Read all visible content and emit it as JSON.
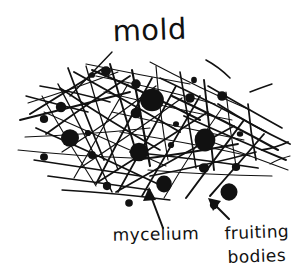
{
  "figure": {
    "title": "mold",
    "medium": "hand-drawn ink sketch on white paper",
    "background_color": "#ffffff",
    "ink_color": "#111111"
  },
  "labels": {
    "mold": {
      "text": "mold",
      "x": 150,
      "y": 40,
      "font_size": 29,
      "leader": "line from label down-left into hyphal mass"
    },
    "mycelium": {
      "text": "mycelium",
      "x": 156,
      "y": 240,
      "font_size": 17,
      "leader": "arrow pointing up into the tangled hyphae"
    },
    "fruiting_bodies": {
      "line1": "fruiting",
      "line2": "bodies",
      "x": 257,
      "y1": 238,
      "y2": 262,
      "font_size": 17,
      "leader": "arrow pointing up-left to a large black dot"
    }
  },
  "drawing": {
    "description": "A tangled mat of thin straight hyphal filaments crossing at many angles, studded with filled black circles representing fruiting bodies and spore heads.",
    "hyphae_count": 58,
    "fruiting_body_count": 26,
    "hyphae": [
      [
        28,
        103,
        118,
        72
      ],
      [
        20,
        120,
        130,
        92
      ],
      [
        25,
        137,
        150,
        128
      ],
      [
        18,
        150,
        132,
        158
      ],
      [
        34,
        160,
        140,
        176
      ],
      [
        48,
        176,
        150,
        190
      ],
      [
        62,
        190,
        170,
        200
      ],
      [
        86,
        64,
        190,
        84
      ],
      [
        96,
        76,
        215,
        104
      ],
      [
        104,
        92,
        232,
        120
      ],
      [
        112,
        112,
        244,
        140
      ],
      [
        120,
        132,
        250,
        156
      ],
      [
        130,
        152,
        258,
        168
      ],
      [
        148,
        170,
        272,
        176
      ],
      [
        60,
        88,
        160,
        150
      ],
      [
        74,
        72,
        180,
        132
      ],
      [
        92,
        70,
        200,
        120
      ],
      [
        44,
        112,
        166,
        166
      ],
      [
        36,
        128,
        158,
        184
      ],
      [
        150,
        62,
        250,
        110
      ],
      [
        160,
        78,
        266,
        132
      ],
      [
        172,
        96,
        278,
        150
      ],
      [
        184,
        116,
        286,
        160
      ],
      [
        196,
        136,
        288,
        170
      ],
      [
        208,
        86,
        282,
        128
      ],
      [
        218,
        104,
        290,
        144
      ],
      [
        68,
        68,
        104,
        160
      ],
      [
        86,
        66,
        118,
        170
      ],
      [
        110,
        64,
        138,
        158
      ],
      [
        132,
        70,
        150,
        166
      ],
      [
        156,
        66,
        168,
        160
      ],
      [
        180,
        72,
        196,
        168
      ],
      [
        204,
        80,
        214,
        170
      ],
      [
        226,
        92,
        236,
        166
      ],
      [
        248,
        104,
        256,
        160
      ],
      [
        42,
        96,
        96,
        186
      ],
      [
        58,
        84,
        112,
        192
      ],
      [
        128,
        84,
        74,
        178
      ],
      [
        152,
        78,
        96,
        184
      ],
      [
        176,
        86,
        118,
        192
      ],
      [
        200,
        96,
        142,
        196
      ],
      [
        222,
        108,
        164,
        198
      ],
      [
        244,
        120,
        186,
        198
      ],
      [
        264,
        134,
        210,
        196
      ],
      [
        30,
        114,
        104,
        68
      ],
      [
        46,
        134,
        130,
        76
      ],
      [
        62,
        152,
        156,
        86
      ],
      [
        80,
        168,
        182,
        98
      ],
      [
        98,
        182,
        208,
        112
      ],
      [
        116,
        192,
        234,
        126
      ],
      [
        26,
        96,
        88,
        112
      ],
      [
        40,
        86,
        110,
        102
      ],
      [
        134,
        160,
        238,
        144
      ],
      [
        150,
        176,
        256,
        152
      ],
      [
        206,
        60,
        230,
        78
      ],
      [
        250,
        92,
        272,
        84
      ],
      [
        262,
        150,
        288,
        142
      ],
      [
        270,
        164,
        290,
        156
      ]
    ],
    "fruiting_bodies": [
      {
        "cx": 152,
        "cy": 100,
        "r": 12
      },
      {
        "cx": 205,
        "cy": 140,
        "r": 11
      },
      {
        "cx": 70,
        "cy": 138,
        "r": 9
      },
      {
        "cx": 139,
        "cy": 152,
        "r": 9
      },
      {
        "cx": 164,
        "cy": 184,
        "r": 8
      },
      {
        "cx": 229,
        "cy": 192,
        "r": 8
      },
      {
        "cx": 106,
        "cy": 71,
        "r": 5
      },
      {
        "cx": 136,
        "cy": 84,
        "r": 5
      },
      {
        "cx": 61,
        "cy": 107,
        "r": 5
      },
      {
        "cx": 190,
        "cy": 98,
        "r": 5
      },
      {
        "cx": 222,
        "cy": 96,
        "r": 5
      },
      {
        "cx": 136,
        "cy": 113,
        "r": 5
      },
      {
        "cx": 204,
        "cy": 168,
        "r": 5
      },
      {
        "cx": 92,
        "cy": 155,
        "r": 4
      },
      {
        "cx": 44,
        "cy": 119,
        "r": 4
      },
      {
        "cx": 44,
        "cy": 157,
        "r": 4
      },
      {
        "cx": 107,
        "cy": 186,
        "r": 4
      },
      {
        "cx": 129,
        "cy": 203,
        "r": 4
      },
      {
        "cx": 214,
        "cy": 205,
        "r": 4
      },
      {
        "cx": 236,
        "cy": 167,
        "r": 4
      },
      {
        "cx": 92,
        "cy": 75,
        "r": 3
      },
      {
        "cx": 194,
        "cy": 80,
        "r": 3
      },
      {
        "cx": 240,
        "cy": 134,
        "r": 3
      },
      {
        "cx": 88,
        "cy": 133,
        "r": 3
      },
      {
        "cx": 171,
        "cy": 145,
        "r": 3
      },
      {
        "cx": 176,
        "cy": 124,
        "r": 3
      }
    ]
  }
}
